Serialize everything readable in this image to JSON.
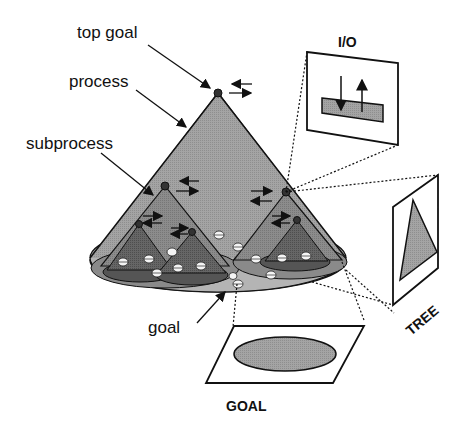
{
  "labels": {
    "top_goal": "top goal",
    "process": "process",
    "subprocess": "subprocess",
    "goal": "goal",
    "io": "I/O",
    "tree": "TREE",
    "goal_panel": "GOAL"
  },
  "colors": {
    "background": "#ffffff",
    "outer_cone": "#a8a8a8",
    "outer_base": "#b8b8b8",
    "inner_base": "#8c8c8c",
    "mid_cone": "#8a8a8a",
    "dark_cone": "#5e5e5e",
    "node": "#333333",
    "ball": "#f4f4f4",
    "panel_fill": "#8f8f8f",
    "stroke": "#111111"
  }
}
